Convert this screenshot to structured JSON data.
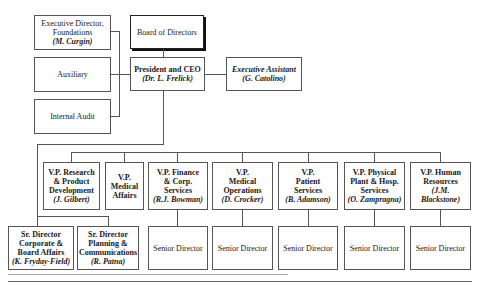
{
  "top": {
    "exec_director": {
      "title": "Executive Director, Foundations",
      "line1": "Executive Director,",
      "line2": "Foundations",
      "name": "(M. Curgin)"
    },
    "auxiliary": {
      "title": "Auxiliary"
    },
    "internal_audit": {
      "title": "Internal Audit"
    },
    "board": {
      "title": "Board of Directors"
    },
    "ceo": {
      "title": "President and CEO",
      "name": "(Dr. L. Frelick)"
    },
    "exec_assistant": {
      "title": "Executive Assistant",
      "name": "(G. Catolino)"
    }
  },
  "vps": [
    {
      "lines": [
        "V.P. Research",
        "& Product",
        "Development"
      ],
      "name": "(J. Gilbert)"
    },
    {
      "lines": [
        "V.P.",
        "Medical",
        "Affairs"
      ],
      "name": ""
    },
    {
      "lines": [
        "V.P. Finance",
        "& Corp.",
        "Services"
      ],
      "name": "(R.J. Bowman)"
    },
    {
      "lines": [
        "V.P.",
        "Medical",
        "Operations"
      ],
      "name": "(D. Crocker)"
    },
    {
      "lines": [
        "V.P.",
        "Patient",
        "Services"
      ],
      "name": "(B. Adamson)"
    },
    {
      "lines": [
        "V.P. Physical",
        "Plant & Hosp.",
        "Services"
      ],
      "name": "(O. Zampragna)"
    },
    {
      "lines": [
        "V.P. Human",
        "Resources",
        "(J.M."
      ],
      "name": "Blackstone)"
    }
  ],
  "sr_directors": [
    {
      "lines": [
        "Sr. Director",
        "Corporate &",
        "Board Affairs"
      ],
      "name": "(K. Fryday-Field)"
    },
    {
      "lines": [
        "Sr. Director",
        "Planning &",
        "Communications"
      ],
      "name": "(R. Patna)"
    }
  ],
  "senior_director_label": "Senior Director"
}
